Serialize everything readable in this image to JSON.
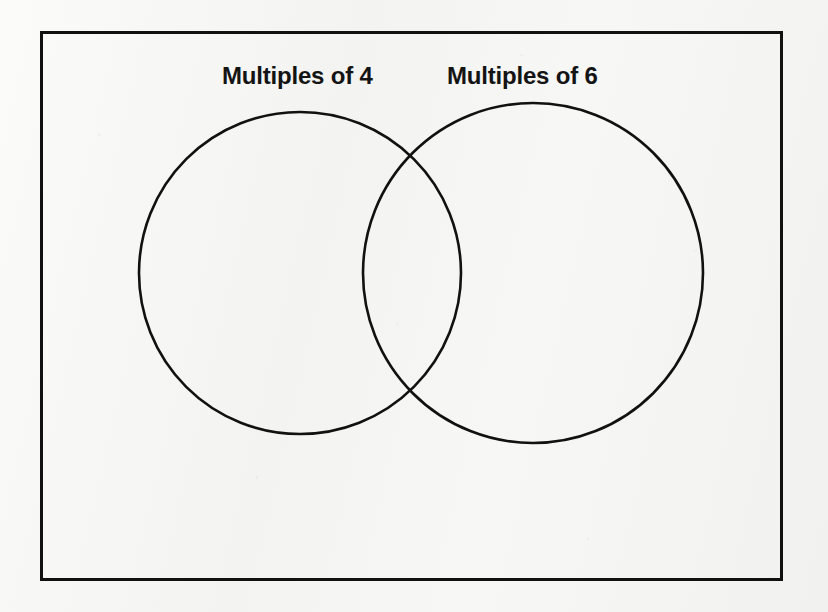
{
  "document": {
    "kind": "venn-diagram-worksheet",
    "background_color": "#f6f6f4",
    "ink_color": "#111111"
  },
  "universal_set": {
    "name": "outer-rectangle",
    "x": 40,
    "y": 31,
    "width": 743,
    "height": 550,
    "stroke_width": 3,
    "stroke_color": "#111111",
    "fill": "none"
  },
  "labels": {
    "left": "Multiples of 4",
    "right": "Multiples of 6"
  },
  "circles": [
    {
      "label": "Multiples of 4",
      "name": "left-circle",
      "cx": 300,
      "cy": 273,
      "r": 161,
      "stroke_width": 2.6,
      "stroke_color": "#111111",
      "fill": "none"
    },
    {
      "label": "Multiples of 6",
      "name": "right-circle",
      "cx": 533,
      "cy": 273,
      "r": 170,
      "stroke_width": 2.6,
      "stroke_color": "#111111",
      "fill": "none"
    }
  ],
  "regions": {
    "left_only": "",
    "intersection": "",
    "right_only": "",
    "outside": ""
  },
  "chart_data": {
    "type": "diagram",
    "diagram_type": "venn",
    "title": "",
    "sets": [
      {
        "name": "Multiples of 4",
        "items": []
      },
      {
        "name": "Multiples of 6",
        "items": []
      }
    ],
    "intersection_items": [],
    "universe_items": []
  }
}
